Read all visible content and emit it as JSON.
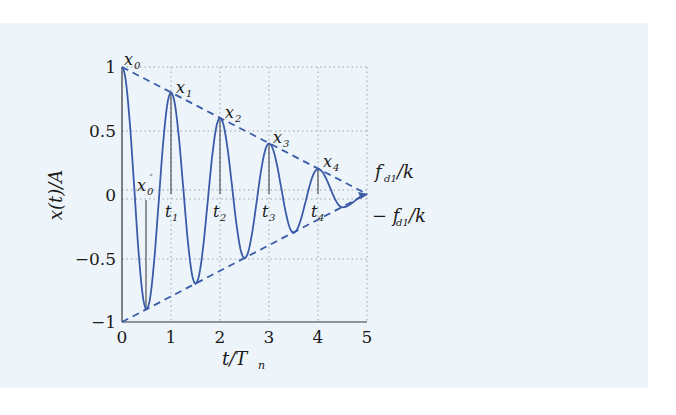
{
  "chart_data": {
    "type": "line",
    "title": "",
    "xlabel": "t/T_n",
    "ylabel": "x(t)/A",
    "xlim": [
      0,
      5
    ],
    "ylim": [
      -1,
      1
    ],
    "grid": true,
    "x_ticks": [
      "0",
      "1",
      "2",
      "3",
      "4",
      "5"
    ],
    "y_ticks": [
      "1",
      "0.5",
      "0",
      "−0.5",
      "−1"
    ],
    "series": [
      {
        "name": "response x(t)/A",
        "style": "solid",
        "color": "#3a5ba8",
        "extrema": [
          {
            "t": 0.0,
            "x": 1.0
          },
          {
            "t": 0.5,
            "x": -0.9
          },
          {
            "t": 1.0,
            "x": 0.8
          },
          {
            "t": 1.5,
            "x": -0.7
          },
          {
            "t": 2.0,
            "x": 0.6
          },
          {
            "t": 2.5,
            "x": -0.5
          },
          {
            "t": 3.0,
            "x": 0.4
          },
          {
            "t": 3.5,
            "x": -0.3
          },
          {
            "t": 4.0,
            "x": 0.2
          },
          {
            "t": 4.5,
            "x": -0.1
          },
          {
            "t": 5.0,
            "x": 0.0
          }
        ]
      },
      {
        "name": "upper envelope",
        "style": "dashed",
        "color": "#3a5ba8",
        "points": [
          {
            "t": 0,
            "x": 1
          },
          {
            "t": 5,
            "x": 0
          }
        ]
      },
      {
        "name": "lower envelope",
        "style": "dashed",
        "color": "#3a5ba8",
        "points": [
          {
            "t": 0,
            "x": -1
          },
          {
            "t": 5,
            "x": 0
          }
        ]
      }
    ],
    "annotations": [
      {
        "label": "x_0",
        "t": 0.0,
        "x": 1.0
      },
      {
        "label": "x_1",
        "t": 1.0,
        "x": 0.8
      },
      {
        "label": "x_2",
        "t": 2.0,
        "x": 0.6
      },
      {
        "label": "x_3",
        "t": 3.0,
        "x": 0.4
      },
      {
        "label": "x_4",
        "t": 4.0,
        "x": 0.2
      },
      {
        "label": "x'_0",
        "t": 0.5,
        "x": 0.0
      },
      {
        "label": "t_1",
        "t": 1.0,
        "x": 0.0
      },
      {
        "label": "t_2",
        "t": 2.0,
        "x": 0.0
      },
      {
        "label": "t_3",
        "t": 3.0,
        "x": 0.0
      },
      {
        "label": "t_4",
        "t": 4.0,
        "x": 0.0
      },
      {
        "label": "f_d1/k",
        "position": "right, above zero"
      },
      {
        "label": "−f_d1/k",
        "position": "right, below zero"
      }
    ]
  },
  "labels": {
    "ylabel": "x(t)/A",
    "xlabel_main": "t/T",
    "xlabel_sub": "n",
    "fd_pos_main": "f",
    "fd_pos_sub": "d1",
    "fd_pos_tail": "/k",
    "fd_neg_main": "− f",
    "fd_neg_sub": "d1",
    "fd_neg_tail": "/k",
    "peaks": [
      "x",
      "x",
      "x",
      "x",
      "x"
    ],
    "peak_subs": [
      "0",
      "1",
      "2",
      "3",
      "4"
    ],
    "x0p_main": "x",
    "x0p_sub": "0",
    "x0p_prime": "´",
    "tlabels": [
      "t",
      "t",
      "t",
      "t"
    ],
    "tsubs": [
      "1",
      "2",
      "3",
      "4"
    ],
    "xticks": [
      "0",
      "1",
      "2",
      "3",
      "4",
      "5"
    ],
    "yticks": [
      "1",
      "0.5",
      "0",
      "−0.5",
      "−1"
    ]
  }
}
